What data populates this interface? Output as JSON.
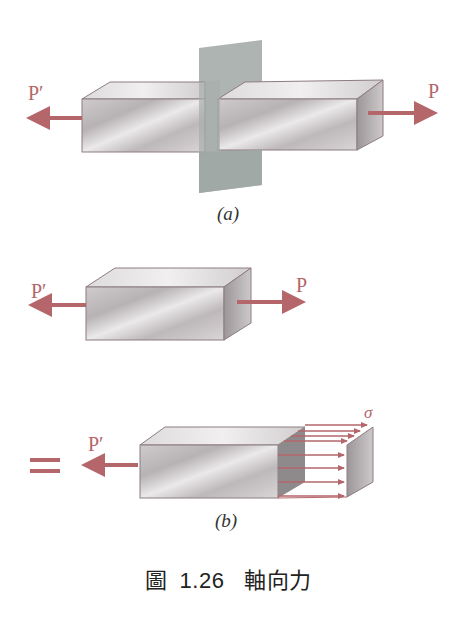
{
  "figure": {
    "caption": {
      "prefix": "圖",
      "number": "1.26",
      "title": "軸向力"
    },
    "panel_a": {
      "label": "(a)",
      "force_left": "P′",
      "force_right": "P"
    },
    "panel_middle": {
      "force_left": "P′",
      "force_right": "P"
    },
    "panel_b": {
      "label": "(b)",
      "force_left": "P′",
      "stress_symbol": "σ",
      "equals_sign": "="
    },
    "colors": {
      "arrow": "#b5666a",
      "block_light": "#e6e3e4",
      "block_dark": "#a9a4a6",
      "plane": "#9fa7a4",
      "edge": "#8c7c80"
    }
  }
}
